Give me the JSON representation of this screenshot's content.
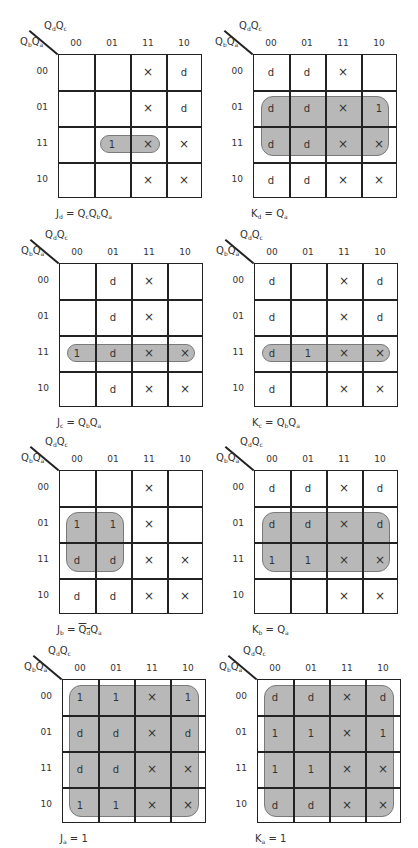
{
  "axis": {
    "col_var": [
      "Q",
      "d",
      "Q",
      "c"
    ],
    "row_var": [
      "Q",
      "b",
      "Q",
      "a"
    ],
    "col_labels": [
      "00",
      "01",
      "11",
      "10"
    ],
    "row_labels": [
      "00",
      "01",
      "11",
      "10"
    ]
  },
  "style": {
    "group_fill": "#a8a8a8",
    "group_border": "#7a7a7a",
    "line": "#222222"
  },
  "maps": [
    {
      "id": "Jd",
      "equation": {
        "lhs": "J",
        "lhs_sub": "d",
        "terms": [
          [
            "Q",
            "c",
            false
          ],
          [
            "Q",
            "b",
            false
          ],
          [
            "Q",
            "a",
            false
          ]
        ]
      },
      "cells": [
        [
          "",
          "",
          "X",
          "d"
        ],
        [
          "",
          "",
          "X",
          "d"
        ],
        [
          "",
          "1",
          "X",
          "X"
        ],
        [
          "",
          "",
          "X",
          "X"
        ]
      ],
      "group": {
        "row_start": 2,
        "row_end": 2,
        "col_start": 1,
        "col_end": 2,
        "inset_x": 6,
        "pill": true
      }
    },
    {
      "id": "Kd",
      "equation": {
        "lhs": "K",
        "lhs_sub": "d",
        "terms": [
          [
            "Q",
            "a",
            false
          ]
        ]
      },
      "cells": [
        [
          "d",
          "d",
          "X",
          ""
        ],
        [
          "d",
          "d",
          "X",
          "1"
        ],
        [
          "d",
          "d",
          "X",
          "X"
        ],
        [
          "d",
          "d",
          "X",
          "X"
        ]
      ],
      "group": {
        "row_start": 1,
        "row_end": 2,
        "col_start": 0,
        "col_end": 3,
        "inset_x": 8,
        "pill": false
      }
    },
    {
      "id": "Jc",
      "equation": {
        "lhs": "J",
        "lhs_sub": "c",
        "terms": [
          [
            "Q",
            "b",
            false
          ],
          [
            "Q",
            "a",
            false
          ]
        ]
      },
      "cells": [
        [
          "",
          "d",
          "X",
          ""
        ],
        [
          "",
          "d",
          "X",
          ""
        ],
        [
          "1",
          "d",
          "X",
          "X"
        ],
        [
          "",
          "d",
          "X",
          "X"
        ]
      ],
      "group": {
        "row_start": 2,
        "row_end": 2,
        "col_start": 0,
        "col_end": 3,
        "inset_x": 8,
        "pill": true
      }
    },
    {
      "id": "Kc",
      "equation": {
        "lhs": "K",
        "lhs_sub": "c",
        "terms": [
          [
            "Q",
            "b",
            false
          ],
          [
            "Q",
            "a",
            false
          ]
        ]
      },
      "cells": [
        [
          "d",
          "",
          "X",
          "d"
        ],
        [
          "d",
          "",
          "X",
          "d"
        ],
        [
          "d",
          "1",
          "X",
          "X"
        ],
        [
          "d",
          "",
          "X",
          "X"
        ]
      ],
      "group": {
        "row_start": 2,
        "row_end": 2,
        "col_start": 0,
        "col_end": 3,
        "inset_x": 8,
        "pill": true
      }
    },
    {
      "id": "Jb",
      "equation": {
        "lhs": "J",
        "lhs_sub": "b",
        "terms": [
          [
            "Q",
            "d",
            true
          ],
          [
            "Q",
            "a",
            false
          ]
        ]
      },
      "cells": [
        [
          "",
          "",
          "X",
          ""
        ],
        [
          "1",
          "1",
          "X",
          ""
        ],
        [
          "d",
          "d",
          "X",
          "X"
        ],
        [
          "d",
          "d",
          "X",
          "X"
        ]
      ],
      "group": {
        "row_start": 1,
        "row_end": 2,
        "col_start": 0,
        "col_end": 1,
        "inset_x": 7,
        "pill": false
      }
    },
    {
      "id": "Kb",
      "equation": {
        "lhs": "K",
        "lhs_sub": "b",
        "terms": [
          [
            "Q",
            "a",
            false
          ]
        ]
      },
      "cells": [
        [
          "d",
          "d",
          "X",
          "d"
        ],
        [
          "d",
          "d",
          "X",
          "d"
        ],
        [
          "1",
          "1",
          "X",
          "X"
        ],
        [
          "",
          "",
          "X",
          "X"
        ]
      ],
      "group": {
        "row_start": 1,
        "row_end": 2,
        "col_start": 0,
        "col_end": 3,
        "inset_x": 8,
        "pill": false
      }
    },
    {
      "id": "Ja",
      "equation": {
        "lhs": "J",
        "lhs_sub": "a",
        "terms": [
          [
            "1",
            "",
            false
          ]
        ]
      },
      "cells": [
        [
          "1",
          "1",
          "X",
          "1"
        ],
        [
          "d",
          "d",
          "X",
          "d"
        ],
        [
          "d",
          "d",
          "X",
          "X"
        ],
        [
          "1",
          "1",
          "X",
          "X"
        ]
      ],
      "group": {
        "row_start": 0,
        "row_end": 3,
        "col_start": 0,
        "col_end": 3,
        "inset_x": 7,
        "pill": false
      }
    },
    {
      "id": "Ka",
      "equation": {
        "lhs": "K",
        "lhs_sub": "a",
        "terms": [
          [
            "1",
            "",
            false
          ]
        ]
      },
      "cells": [
        [
          "d",
          "d",
          "X",
          "d"
        ],
        [
          "1",
          "1",
          "X",
          "1"
        ],
        [
          "1",
          "1",
          "X",
          "X"
        ],
        [
          "d",
          "d",
          "X",
          "X"
        ]
      ],
      "group": {
        "row_start": 0,
        "row_end": 3,
        "col_start": 0,
        "col_end": 3,
        "inset_x": 7,
        "pill": false
      }
    }
  ]
}
